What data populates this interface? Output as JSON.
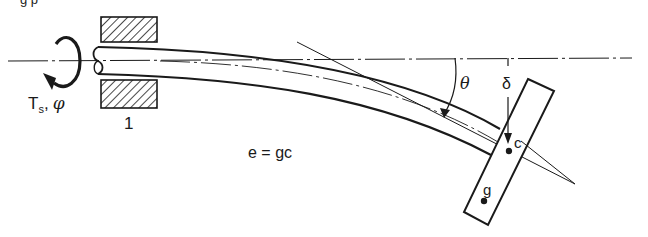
{
  "figure": {
    "top_caption_fragment": "g   p",
    "labels": {
      "torque": "T",
      "torque_sub": "s",
      "torque_sep": ",",
      "torque_angle": "φ",
      "support_number": "1",
      "equation": "e = gc",
      "angle_theta": "θ",
      "deflection_delta": "δ",
      "point_c": "c",
      "point_g": "g"
    },
    "colors": {
      "ink": "#1a1a1a",
      "background": "#ffffff"
    }
  }
}
